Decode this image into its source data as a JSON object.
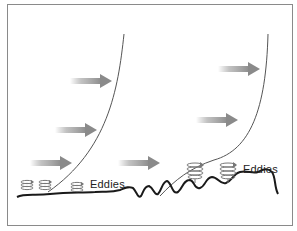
{
  "diagram": {
    "labels": {
      "left_eddies": "Eddies",
      "right_eddies": "Eddies"
    },
    "colors": {
      "frame": "#8a8a8a",
      "curve": "#555555",
      "ground": "#1a1a1a",
      "arrow": "#8f8f8f",
      "eddy": "#777777"
    },
    "panels": [
      {
        "name": "smooth-surface",
        "arrows": 3,
        "eddies": 3
      },
      {
        "name": "rough-surface",
        "arrows": 3,
        "eddies": 2
      }
    ]
  }
}
